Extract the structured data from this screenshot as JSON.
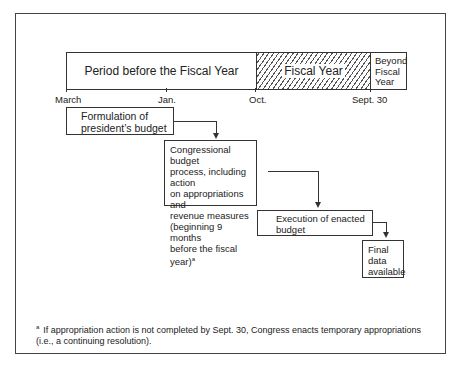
{
  "timeline": {
    "segments": {
      "before": "Period before the Fiscal Year",
      "fiscal": "Fiscal Year",
      "beyond": [
        "Beyond",
        "Fiscal",
        "Year"
      ]
    },
    "ticks": [
      "March",
      "Jan.",
      "Oct.",
      "Sept. 30"
    ]
  },
  "steps": [
    {
      "lines": [
        "Formulation of",
        "president’s budget"
      ]
    },
    {
      "lines": [
        "Congressional budget",
        "process, including action",
        "on appropriations and",
        "revenue measures",
        "(beginning 9 months",
        "before the fiscal year)"
      ],
      "footnote_mark": "a"
    },
    {
      "lines": [
        "Execution of enacted",
        "budget"
      ]
    },
    {
      "lines": [
        "Final",
        "data",
        "available"
      ]
    }
  ],
  "footnote": {
    "mark": "a",
    "text": "If appropriation action is not completed by Sept. 30, Congress enacts temporary appropriations (i.e., a continuing resolution)."
  }
}
